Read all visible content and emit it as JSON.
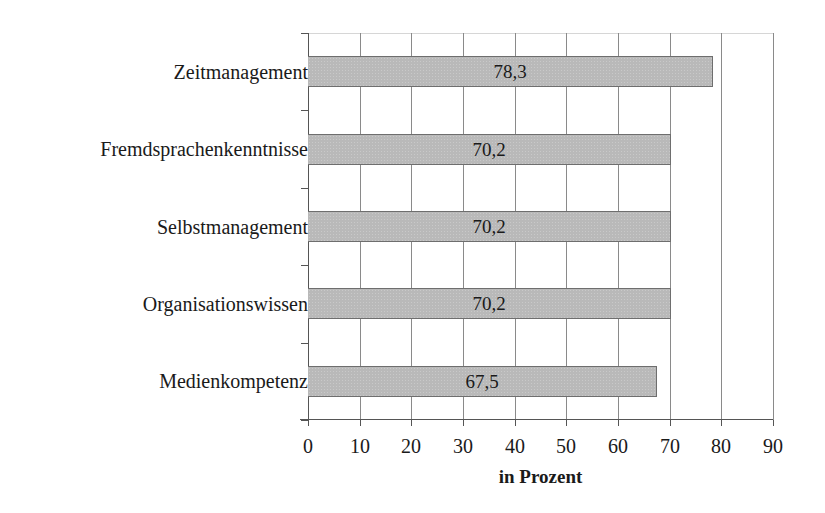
{
  "chart_data": {
    "type": "bar",
    "orientation": "horizontal",
    "title": "",
    "xlabel": "in Prozent",
    "ylabel": "",
    "xlim": [
      0,
      90
    ],
    "x_ticks": [
      0,
      10,
      20,
      30,
      40,
      50,
      60,
      70,
      80,
      90
    ],
    "grid": true,
    "legend": null,
    "categories": [
      "Zeitmanagement",
      "Fremdsprachenkenntnisse",
      "Selbstmanagement",
      "Organisationswissen",
      "Medienkompetenz"
    ],
    "values": [
      78.3,
      70.2,
      70.2,
      70.2,
      67.5
    ],
    "value_labels": [
      "78,3",
      "70,2",
      "70,2",
      "70,2",
      "67,5"
    ],
    "bar_color": "#b9b9b9"
  },
  "x_tick_labels": [
    "0",
    "10",
    "20",
    "30",
    "40",
    "50",
    "60",
    "70",
    "80",
    "90"
  ]
}
